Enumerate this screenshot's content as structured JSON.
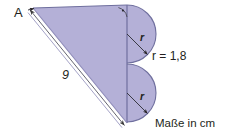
{
  "figure": {
    "units_note": "Maße in cm",
    "colors": {
      "fill": "#b4b0d7",
      "stroke": "#6f6f9e",
      "outline_light": "#8d8ab8",
      "text": "#231f20",
      "background": "#ffffff"
    },
    "labels": {
      "vertex_a": "A",
      "side_hypotenuse": "9",
      "radius_top": "r",
      "radius_bottom": "r",
      "radius_value": "r = 1,8",
      "units": "Maße in cm"
    },
    "shapes": {
      "triangle": {
        "name": "right-triangle",
        "vertices": [
          {
            "name": "A",
            "x": 33,
            "y": 8
          },
          {
            "name": "B",
            "x": 127,
            "y": 5
          },
          {
            "name": "C",
            "x": 127,
            "y": 123
          }
        ],
        "right_angle_at": "B"
      },
      "semicircle_top": {
        "name": "upper-semicircle",
        "center_x": 127,
        "center_y": 34,
        "radius": 29,
        "bulge": "right"
      },
      "semicircle_bottom": {
        "name": "lower-semicircle",
        "center_x": 127,
        "center_y": 93,
        "radius": 29,
        "bulge": "right"
      }
    },
    "annotations": {
      "right_angle_marker": "right-angle-arc-with-dot",
      "dimension_line": "hypotenuse-double-line-with-arrows",
      "pointer_a": "leader-arrow-to-vertex-a"
    }
  }
}
